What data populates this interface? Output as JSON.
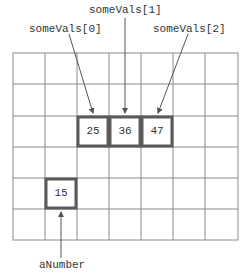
{
  "diagram": {
    "grid": {
      "columns": 7,
      "rows": 6,
      "line_color": "#888888",
      "highlight_color": "#555555"
    },
    "labels": {
      "someVals0": "someVals[0]",
      "someVals1": "someVals[1]",
      "someVals2": "someVals[2]",
      "aNumber": "aNumber"
    },
    "cells": {
      "someVals0": "25",
      "someVals1": "36",
      "someVals2": "47",
      "aNumber": "15"
    }
  }
}
